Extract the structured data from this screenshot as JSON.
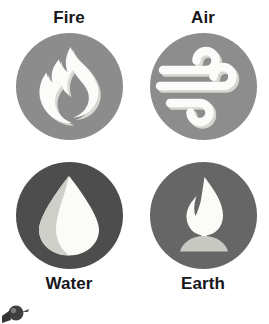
{
  "page": {
    "background_color": "#ffffff",
    "layout": "2x2-grid",
    "title_text_color": "#17171a"
  },
  "elements": [
    {
      "key": "fire",
      "label": "Fire",
      "label_position": "above",
      "icon_name": "flame-icon",
      "disc_color": "#8c8c8c",
      "glyph_color": "#fbfbf9",
      "glyph_shadow_color": "#d8d8d2"
    },
    {
      "key": "air",
      "label": "Air",
      "label_position": "above",
      "icon_name": "wind-icon",
      "disc_color": "#8d8d8d",
      "glyph_color": "#fbfbf9",
      "glyph_shadow_color": "#d6d6d0"
    },
    {
      "key": "water",
      "label": "Water",
      "label_position": "below",
      "icon_name": "water-drop-icon",
      "disc_color": "#4d4d4d",
      "glyph_color": "#fbfbf7",
      "glyph_shadow_color": "#cfcfc9"
    },
    {
      "key": "earth",
      "label": "Earth",
      "label_position": "below",
      "icon_name": "leaf-sprout-icon",
      "disc_color": "#666666",
      "glyph_color": "#fbfbf7",
      "glyph_shadow_color": "#c9c9c3"
    }
  ],
  "watermark": {
    "name": "watermark-artifact",
    "color": "#2b2b2b"
  }
}
